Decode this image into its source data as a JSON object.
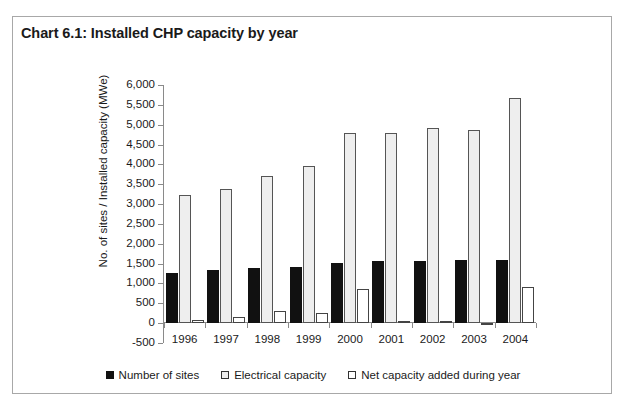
{
  "chart": {
    "title": "Chart 6.1: Installed CHP capacity by year"
  },
  "colors": {
    "sites": "#111111",
    "electrical": "#eeeeee",
    "netadd": "#ffffff",
    "frame": "#a8a8a8",
    "axis": "#8a8a8a",
    "text": "#1a1a1a"
  },
  "legend": [
    {
      "label": "Number of sites",
      "key": "sites"
    },
    {
      "label": "Electrical capacity",
      "key": "electrical"
    },
    {
      "label": "Net capacity added during year",
      "key": "netadd"
    }
  ],
  "chart_data": {
    "type": "bar",
    "title": "Chart 6.1: Installed CHP capacity by year",
    "subtitle": "",
    "xlabel": "",
    "ylabel": "No. of sites / Installed capacity (MWe)",
    "ylim": [
      -500,
      6000
    ],
    "ytick_step": 500,
    "ytick_labels": [
      "6,000",
      "5,500",
      "5,000",
      "4,500",
      "4,000",
      "3,500",
      "3,000",
      "2,500",
      "2,000",
      "1,500",
      "1,000",
      "500",
      "0",
      "-500"
    ],
    "ytick_values": [
      6000,
      5500,
      5000,
      4500,
      4000,
      3500,
      3000,
      2500,
      2000,
      1500,
      1000,
      500,
      0,
      -500
    ],
    "grid": false,
    "legend_position": "bottom",
    "categories": [
      "1996",
      "1997",
      "1998",
      "1999",
      "2000",
      "2001",
      "2002",
      "2003",
      "2004"
    ],
    "series": [
      {
        "name": "Number of sites",
        "values": [
          1270,
          1340,
          1380,
          1420,
          1520,
          1570,
          1570,
          1580,
          1580
        ]
      },
      {
        "name": "Electrical capacity",
        "values": [
          3220,
          3390,
          3700,
          3970,
          4790,
          4790,
          4920,
          4860,
          5680
        ]
      },
      {
        "name": "Net capacity added during year",
        "values": [
          90,
          160,
          310,
          260,
          870,
          20,
          60,
          -50,
          900
        ]
      }
    ]
  }
}
